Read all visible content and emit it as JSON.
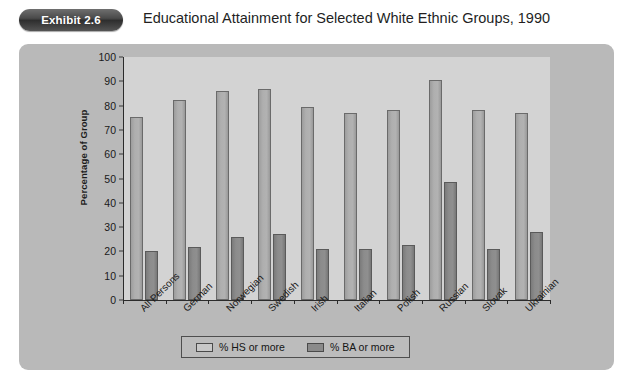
{
  "header": {
    "exhibit_badge": "Exhibit 2.6",
    "title": "Educational Attainment for Selected White Ethnic Groups, 1990"
  },
  "legend": {
    "items": [
      {
        "label": "% HS or more",
        "swatch": "light-grey-swatch",
        "color": "#c8c8c8"
      },
      {
        "label": "% BA or more",
        "swatch": "dark-grey-swatch",
        "color": "#8a8a8a"
      }
    ]
  },
  "colors": {
    "page_background": "#ffffff",
    "panel_background": "#b9b9b9",
    "plot_background": "#d3d3d3",
    "badge_background": "#3a3a3a",
    "series_hs": "#afafaf",
    "series_ba": "#8c8c8c",
    "axis": "#2b2b2b"
  },
  "chart_data": {
    "type": "bar",
    "title": "Educational Attainment for Selected White Ethnic Groups, 1990",
    "xlabel": "",
    "ylabel": "Percentage of Group",
    "ylim": [
      0,
      100
    ],
    "ytick_step": 10,
    "yticks": [
      0,
      10,
      20,
      30,
      40,
      50,
      60,
      70,
      80,
      90,
      100
    ],
    "grid": false,
    "legend_position": "bottom-center",
    "categories": [
      "All Persons",
      "German",
      "Norwegian",
      "Swedish",
      "Irish",
      "Italian",
      "Polish",
      "Russian",
      "Slovak",
      "Ukrainian"
    ],
    "series": [
      {
        "name": "% HS or more",
        "values": [
          75.5,
          82.5,
          86.0,
          87.0,
          79.5,
          77.0,
          78.0,
          90.5,
          78.0,
          77.0
        ]
      },
      {
        "name": "% BA or more",
        "values": [
          20.3,
          22.0,
          26.0,
          27.0,
          21.0,
          20.8,
          22.7,
          48.5,
          21.0,
          28.0
        ]
      }
    ]
  }
}
